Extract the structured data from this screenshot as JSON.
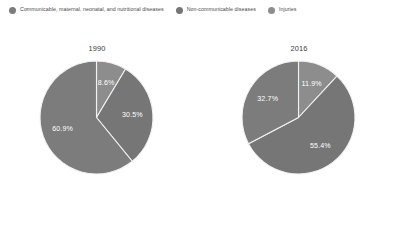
{
  "legend": {
    "position": "top",
    "items": [
      {
        "label": "Communicable, maternal, neonatal, and nutritional diseases",
        "color": "#7c7c7c",
        "icon": "circle-marker-icon"
      },
      {
        "label": "Non-communicable diseases",
        "color": "#767676",
        "icon": "circle-marker-icon"
      },
      {
        "label": "Injuries",
        "color": "#8d8d8d",
        "icon": "circle-marker-icon"
      }
    ]
  },
  "chart_data": [
    {
      "type": "pie",
      "title": "1990",
      "categories": [
        "Injuries",
        "Non-communicable diseases",
        "Communicable, maternal, neonatal, and nutritional diseases"
      ],
      "values": [
        8.6,
        30.5,
        60.9
      ],
      "labels": [
        "8.6%",
        "30.5%",
        "60.9%"
      ],
      "colors": [
        "#8d8d8d",
        "#767676",
        "#7c7c7c"
      ],
      "start_angle_deg": 0,
      "direction": "clockwise",
      "xlabel": "",
      "ylabel": "",
      "legend": "top"
    },
    {
      "type": "pie",
      "title": "2016",
      "categories": [
        "Injuries",
        "Non-communicable diseases",
        "Communicable, maternal, neonatal, and nutritional diseases"
      ],
      "values": [
        11.9,
        55.4,
        32.7
      ],
      "labels": [
        "11.9%",
        "55.4%",
        "32.7%"
      ],
      "colors": [
        "#8d8d8d",
        "#767676",
        "#7c7c7c"
      ],
      "start_angle_deg": 0,
      "direction": "clockwise",
      "xlabel": "",
      "ylabel": "",
      "legend": "top"
    }
  ]
}
